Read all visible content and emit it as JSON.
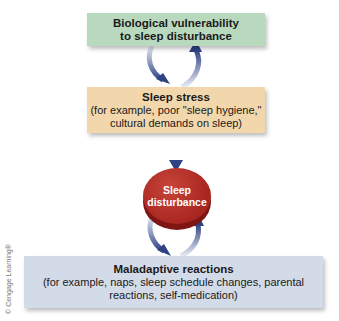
{
  "diagram": {
    "nodes": [
      {
        "id": "bio",
        "title": "Biological vulnerability",
        "title2": "to sleep disturbance",
        "color": "#b9d9bf"
      },
      {
        "id": "stress",
        "title": "Sleep stress",
        "line1": "(for example, poor \"sleep hygiene,\"",
        "line2": "cultural demands on sleep)",
        "color": "#f3d7ac"
      },
      {
        "id": "disturbance",
        "line1": "Sleep",
        "line2": "disturbance",
        "color": "#a82620"
      },
      {
        "id": "maladaptive",
        "title": "Maladaptive reactions",
        "line1": "(for example, naps, sleep schedule changes, parental",
        "line2": "reactions, self-medication)",
        "color": "#d3dbe9"
      }
    ],
    "edges": [
      {
        "from": "bio",
        "to": "stress"
      },
      {
        "from": "stress",
        "to": "bio"
      },
      {
        "from": "stress",
        "to": "disturbance"
      },
      {
        "from": "disturbance",
        "to": "maladaptive"
      },
      {
        "from": "maladaptive",
        "to": "disturbance"
      }
    ],
    "credit": "© Cengage Learning®",
    "arrow_color": "#3b4f8a"
  }
}
